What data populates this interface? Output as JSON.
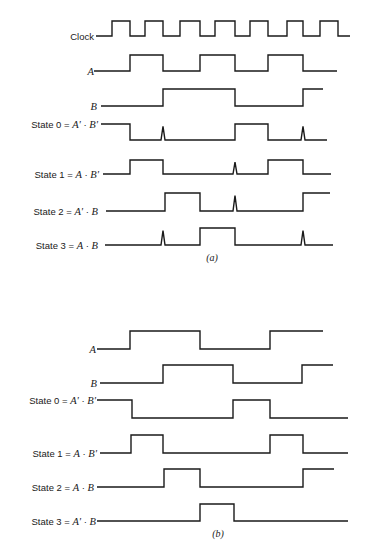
{
  "diagram": {
    "ink_color": "#1a1a1a",
    "background": "#ffffff",
    "panels": [
      {
        "id": "a",
        "caption": "(a)",
        "caption_pos": [
          212,
          261
        ],
        "signals": [
          {
            "name": "Clock",
            "label_parts": [
              {
                "t": "Clock",
                "italic": false
              }
            ],
            "label_end_x": 94,
            "y_low": 36,
            "y_high": 21,
            "start_x": 96,
            "end_x": 350,
            "start_level": 0,
            "edges": [
              112,
              130,
              145,
              163,
              180,
              200,
              215,
              235,
              250,
              268,
              287,
              303,
              320,
              338
            ],
            "spikes": []
          },
          {
            "name": "A",
            "label_parts": [
              {
                "t": "A",
                "italic": true
              }
            ],
            "label_end_x": 94,
            "y_low": 71,
            "y_high": 55,
            "start_x": 94,
            "end_x": 337,
            "start_level": 0,
            "edges": [
              130,
              163,
              200,
              235,
              268,
              303
            ],
            "spikes": []
          },
          {
            "name": "B",
            "label_parts": [
              {
                "t": "B",
                "italic": true
              }
            ],
            "label_end_x": 97,
            "y_low": 106,
            "y_high": 89,
            "start_x": 101,
            "end_x": 323,
            "start_level": 0,
            "edges": [
              163,
              235,
              303
            ],
            "spikes": []
          },
          {
            "name": "State 0",
            "label_parts": [
              {
                "t": "State 0 = ",
                "italic": false
              },
              {
                "t": "A'",
                "italic": true
              },
              {
                "t": " · ",
                "italic": false
              },
              {
                "t": "B'",
                "italic": true
              }
            ],
            "label_end_x": 98,
            "y_low": 140,
            "y_high": 124,
            "start_x": 101,
            "end_x": 327,
            "start_level": 1,
            "edges": [
              130,
              235,
              268
            ],
            "spikes": [
              163,
              303
            ]
          },
          {
            "name": "State 1",
            "label_parts": [
              {
                "t": "State 1 = ",
                "italic": false
              },
              {
                "t": "A",
                "italic": true
              },
              {
                "t": " ·  ",
                "italic": false
              },
              {
                "t": "B'",
                "italic": true
              }
            ],
            "label_end_x": 99,
            "y_low": 174,
            "y_high": 160,
            "start_x": 103,
            "end_x": 331,
            "start_level": 0,
            "edges": [
              130,
              163,
              268,
              303
            ],
            "spikes": [
              235
            ]
          },
          {
            "name": "State 2",
            "label_parts": [
              {
                "t": "State 2 = ",
                "italic": false
              },
              {
                "t": "A'",
                "italic": true
              },
              {
                "t": " · ",
                "italic": false
              },
              {
                "t": "B",
                "italic": true
              }
            ],
            "label_end_x": 98,
            "y_low": 211,
            "y_high": 193,
            "start_x": 106,
            "end_x": 330,
            "start_level": 0,
            "edges": [
              165,
              200,
              303
            ],
            "spikes": [
              235
            ]
          },
          {
            "name": "State 3",
            "label_parts": [
              {
                "t": "State 3 = ",
                "italic": false
              },
              {
                "t": "A",
                "italic": true
              },
              {
                "t": " · ",
                "italic": false
              },
              {
                "t": "B",
                "italic": true
              }
            ],
            "label_end_x": 98,
            "y_low": 245,
            "y_high": 228,
            "start_x": 105,
            "end_x": 333,
            "start_level": 0,
            "edges": [
              200,
              235
            ],
            "spikes": [
              163,
              303
            ]
          }
        ]
      },
      {
        "id": "b",
        "caption": "(b)",
        "caption_pos": [
          218,
          537
        ],
        "signals": [
          {
            "name": "A",
            "label_parts": [
              {
                "t": "A",
                "italic": true
              }
            ],
            "label_end_x": 96,
            "y_low": 349,
            "y_high": 331,
            "start_x": 97,
            "end_x": 323,
            "start_level": 0,
            "edges": [
              130,
              200,
              270
            ],
            "spikes": []
          },
          {
            "name": "B",
            "label_parts": [
              {
                "t": "B",
                "italic": true
              }
            ],
            "label_end_x": 97,
            "y_low": 383,
            "y_high": 365,
            "start_x": 100,
            "end_x": 333,
            "start_level": 0,
            "edges": [
              163,
              233,
              302
            ],
            "spikes": []
          },
          {
            "name": "State 0",
            "label_parts": [
              {
                "t": "State 0 = ",
                "italic": false
              },
              {
                "t": "A'",
                "italic": true
              },
              {
                "t": " · ",
                "italic": false
              },
              {
                "t": "B'",
                "italic": true
              }
            ],
            "label_end_x": 96,
            "y_low": 418,
            "y_high": 400,
            "start_x": 97,
            "end_x": 348,
            "start_level": 1,
            "edges": [
              132,
              233,
              270
            ],
            "spikes": []
          },
          {
            "name": "State 1",
            "label_parts": [
              {
                "t": "State 1 = ",
                "italic": false
              },
              {
                "t": "A",
                "italic": true
              },
              {
                "t": " · ",
                "italic": false
              },
              {
                "t": "B'",
                "italic": true
              }
            ],
            "label_end_x": 97,
            "y_low": 453,
            "y_high": 435,
            "start_x": 100,
            "end_x": 348,
            "start_level": 0,
            "edges": [
              131,
              163,
              270,
              303
            ],
            "spikes": []
          },
          {
            "name": "State 2",
            "label_parts": [
              {
                "t": "State 2 = ",
                "italic": false
              },
              {
                "t": "A",
                "italic": true
              },
              {
                "t": " · ",
                "italic": false
              },
              {
                "t": "B",
                "italic": true
              }
            ],
            "label_end_x": 94,
            "y_low": 487,
            "y_high": 469,
            "start_x": 97,
            "end_x": 334,
            "start_level": 0,
            "edges": [
              164,
              200,
              303
            ],
            "spikes": []
          },
          {
            "name": "State 3",
            "label_parts": [
              {
                "t": "State 3 = ",
                "italic": false
              },
              {
                "t": "A'",
                "italic": true
              },
              {
                "t": " · ",
                "italic": false
              },
              {
                "t": "B",
                "italic": true
              }
            ],
            "label_end_x": 96,
            "y_low": 521,
            "y_high": 504,
            "start_x": 97,
            "end_x": 348,
            "start_level": 0,
            "edges": [
              200,
              234
            ],
            "spikes": []
          }
        ]
      }
    ]
  }
}
